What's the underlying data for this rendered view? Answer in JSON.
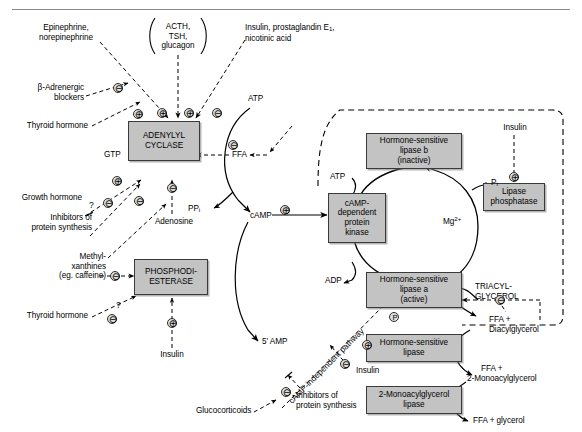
{
  "figure": {
    "type": "biochemical-pathway-diagram",
    "box_fill": "#c3c3c3",
    "box_border": "#3a3a3a",
    "line_color": "#000000"
  },
  "enzymes": [
    {
      "id": "adenylyl-cyclase",
      "lines": [
        "ADENYLYL",
        "CYCLASE"
      ]
    },
    {
      "id": "phosphodiesterase",
      "lines": [
        "PHOSPHODI-",
        "ESTERASE"
      ]
    },
    {
      "id": "camp-dependent-protein-kinase",
      "lines": [
        "cAMP-",
        "dependent",
        "protein",
        "kinase"
      ]
    },
    {
      "id": "hormone-sensitive-lipase-b",
      "lines": [
        "Hormone-sensitive",
        "lipase b",
        "(inactive)"
      ]
    },
    {
      "id": "hormone-sensitive-lipase-a",
      "lines": [
        "Hormone-sensitive",
        "lipase a",
        "(active)"
      ]
    },
    {
      "id": "lipase-phosphatase",
      "lines": [
        "Lipase",
        "phosphatase"
      ]
    },
    {
      "id": "hormone-sensitive-lipase",
      "lines": [
        "Hormone-sensitive",
        "lipase"
      ]
    },
    {
      "id": "monoacylglycerol-lipase",
      "lines": [
        "2-Monoacylglycerol",
        "lipase"
      ]
    }
  ],
  "regulators": {
    "epinephrine": "Epinephrine,\nnorepinephrine",
    "epinephrine_l1": "Epinephrine,",
    "epinephrine_l2": "norepinephrine",
    "acth_l1": "ACTH,",
    "acth_l2": "TSH,",
    "acth_l3": "glucagon",
    "insulin_pge1_l1": "Insulin, prostaglandin E",
    "insulin_pge1_sub": "1",
    "insulin_pge1_tail": ",",
    "insulin_pge1_l2": "nicotinic acid",
    "beta_blockers_l1": "β-Adrenergic",
    "beta_blockers_l2": "blockers",
    "thyroid_hormone_top": "Thyroid hormone",
    "growth_hormone": "Growth hormone",
    "inhibitors_l1": "Inhibitors of",
    "inhibitors_l2": "protein synthesis",
    "methylxanthines_l1": "Methyl-",
    "methylxanthines_l2": "xanthines",
    "methylxanthines_l3": "(eg. caffeine)",
    "thyroid_hormone_bottom": "Thyroid hormone",
    "insulin_pde": "Insulin",
    "adenosine": "Adenosine",
    "insulin_phosphatase": "Insulin",
    "insulin_independent": "Insulin",
    "glucocorticoids": "Glucocorticoids",
    "inhibitors2_l1": "Inhibitors of",
    "inhibitors2_l2": "protein synthesis"
  },
  "metabolites": {
    "gtp": "GTP",
    "atp_top": "ATP",
    "ffa_inhibit": "FFA",
    "ppi_main": "PP",
    "ppi_sub": "i",
    "camp": "cAMP",
    "amp5": "5' AMP",
    "atp_cycle": "ATP",
    "adp_cycle": "ADP",
    "pi_main": "P",
    "pi_sub": "i",
    "mg_main": "Mg",
    "mg_sup": "2+",
    "triacylglycerol_l1": "TRIACYL-",
    "triacylglycerol_l2": "GLYCEROL",
    "ffa_diacyl_l1": "FFA +",
    "ffa_diacyl_l2": "Diacylglycerol",
    "ffa_monoacyl_l1": "FFA +",
    "ffa_monoacyl_l2": "2-Monoacylglycerol",
    "ffa_glycerol": "FFA + glycerol"
  },
  "pathway_label": {
    "camp_independent": "cAMP-independent pathway"
  },
  "signs": {
    "plus": "⊕",
    "minus": "⊖",
    "phosphate": "P",
    "question": "?"
  }
}
